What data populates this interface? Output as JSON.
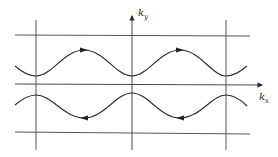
{
  "diagram": {
    "type": "fermi-surface-open-orbits",
    "axes": {
      "x_label": "k",
      "x_subscript": "x",
      "y_label": "k",
      "y_subscript": "y"
    },
    "grid": {
      "vertical_lines_x": [
        36,
        132,
        226
      ],
      "horizontal_lines_y": [
        35,
        84,
        134
      ]
    },
    "orbits": [
      {
        "name": "upper-open-orbit",
        "direction": "right",
        "arrow_count": 2
      },
      {
        "name": "lower-open-orbit",
        "direction": "left",
        "arrow_count": 2
      }
    ],
    "colors": {
      "line": "#2a2a2a",
      "background": "#ffffff"
    }
  }
}
